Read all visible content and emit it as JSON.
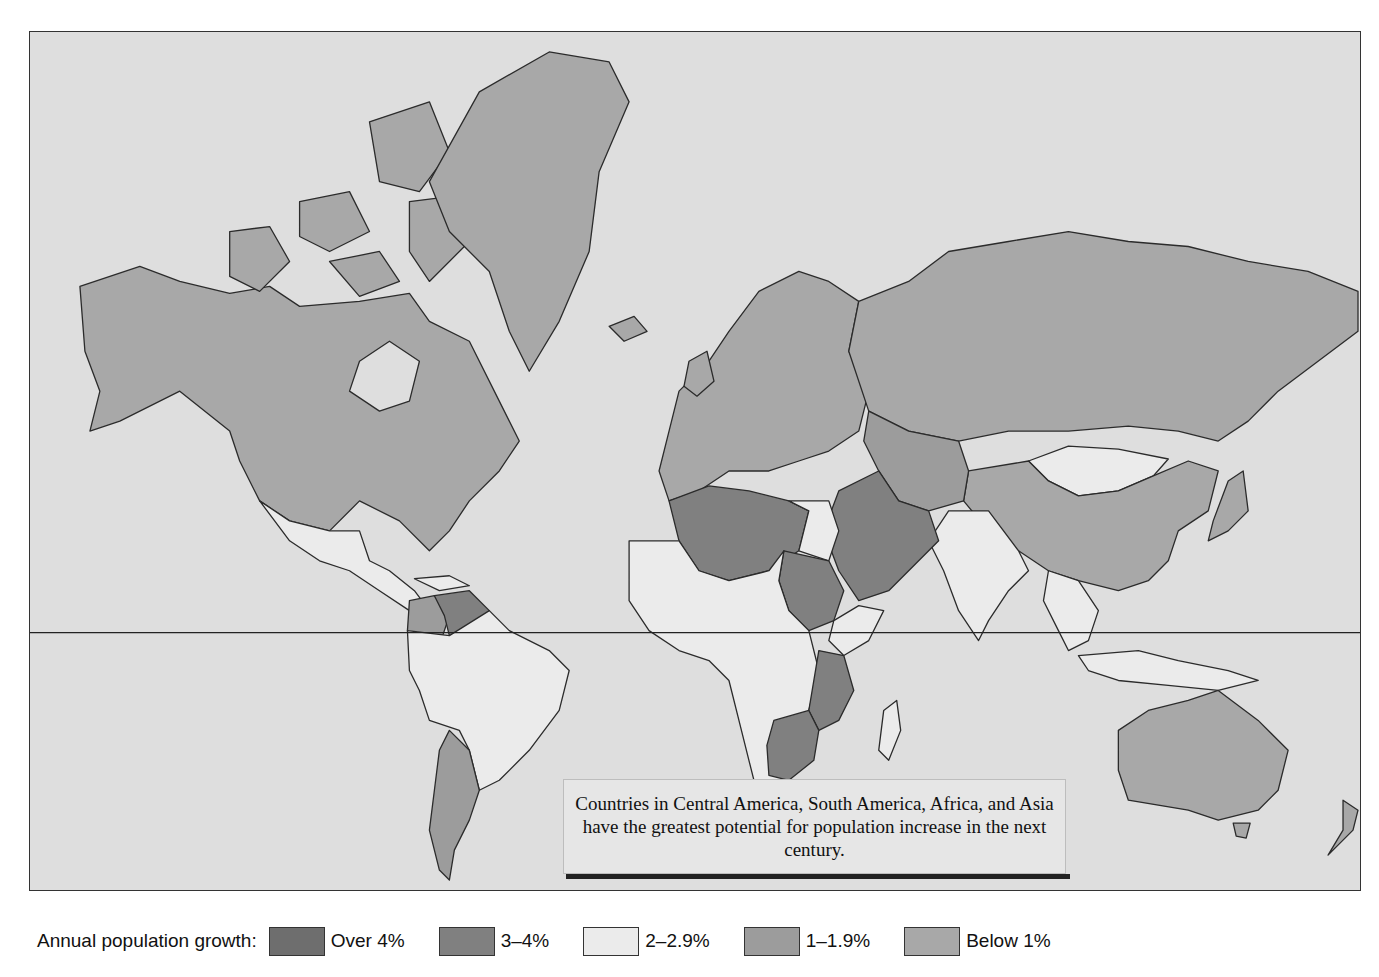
{
  "map": {
    "title": "Annual population growth by country",
    "equator_line": true,
    "ocean_color": "#dedede",
    "categories": {
      "over_4": {
        "label": "Over 4%",
        "color": "#6e6e6e"
      },
      "3_4": {
        "label": "3–4%",
        "color": "#808080"
      },
      "2_2_9": {
        "label": "2–2.9%",
        "color": "#ebebeb"
      },
      "1_1_9": {
        "label": "1–1.9%",
        "color": "#9c9c9c"
      },
      "below_1": {
        "label": "Below 1%",
        "color": "#a8a8a8"
      }
    },
    "regions": [
      {
        "name": "North America (USA/Canada)",
        "category": "below_1"
      },
      {
        "name": "Greenland",
        "category": "below_1"
      },
      {
        "name": "Mexico & Central America",
        "category": "2_2_9"
      },
      {
        "name": "Venezuela",
        "category": "3_4"
      },
      {
        "name": "Colombia",
        "category": "1_1_9"
      },
      {
        "name": "Brazil & Peru & Bolivia",
        "category": "2_2_9"
      },
      {
        "name": "Argentina & Chile & Uruguay",
        "category": "1_1_9"
      },
      {
        "name": "Europe",
        "category": "below_1"
      },
      {
        "name": "Russia",
        "category": "below_1"
      },
      {
        "name": "Mongolia",
        "category": "2_2_9"
      },
      {
        "name": "China",
        "category": "below_1"
      },
      {
        "name": "India",
        "category": "2_2_9"
      },
      {
        "name": "Southeast Asia",
        "category": "2_2_9"
      },
      {
        "name": "Middle East (Iran, Iraq, Saudi Arabia)",
        "category": "3_4"
      },
      {
        "name": "North Africa (Algeria, Libya)",
        "category": "3_4"
      },
      {
        "name": "Egypt",
        "category": "2_2_9"
      },
      {
        "name": "Sudan",
        "category": "3_4"
      },
      {
        "name": "East Africa (Kenya, Tanzania)",
        "category": "3_4"
      },
      {
        "name": "Zambia, Zimbabwe, Botswana",
        "category": "3_4"
      },
      {
        "name": "Central & West Africa",
        "category": "2_2_9"
      },
      {
        "name": "Australia",
        "category": "below_1"
      },
      {
        "name": "New Zealand",
        "category": "below_1"
      }
    ]
  },
  "callout": {
    "text": "Countries in Central America, South America, Africa, and Asia have the greatest potential for population increase in the next century."
  },
  "legend": {
    "title": "Annual population growth:",
    "items": [
      {
        "label": "Over 4%",
        "color": "#6e6e6e"
      },
      {
        "label": "3–4%",
        "color": "#808080"
      },
      {
        "label": "2–2.9%",
        "color": "#ebebeb"
      },
      {
        "label": "1–1.9%",
        "color": "#9c9c9c"
      },
      {
        "label": "Below 1%",
        "color": "#a8a8a8"
      }
    ]
  }
}
